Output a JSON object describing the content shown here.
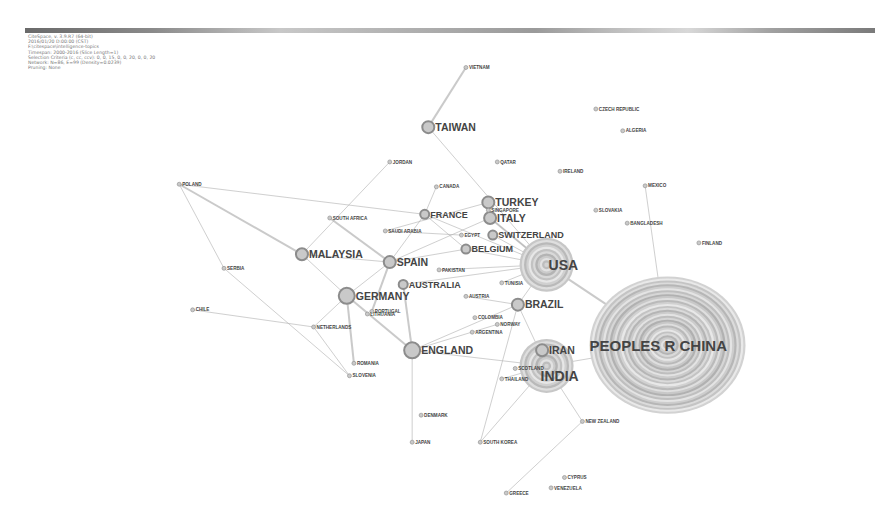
{
  "header": {
    "info_lines": [
      "CiteSpace, v. 3.9.R7 (64-bit)",
      "2016/01/20 D:00:00 (CST)",
      "F:\\citespace\\intelligence-topics",
      "Timespan: 2000-2016 (Slice Length=1)",
      "Selection Criteria (c, cc, ccv): 0, 0, 15, 0, 0, 20, 0, 0, 20",
      "Network: N=86, E=99 (Density=0.0239)",
      "Pruning: None"
    ]
  },
  "colors": {
    "node_ring": "#8c8c8c",
    "node_fill": "#c9c9c9",
    "edge": "#b4b4b4",
    "label": "#444444"
  },
  "network": {
    "nodes": [
      {
        "id": "china",
        "label": "PEOPLES R CHINA",
        "size": 10,
        "x": 0.745,
        "y": 0.665
      },
      {
        "id": "usa",
        "label": "USA",
        "size": 6,
        "x": 0.61,
        "y": 0.51
      },
      {
        "id": "india",
        "label": "INDIA",
        "size": 6,
        "x": 0.61,
        "y": 0.705
      },
      {
        "id": "iran",
        "label": "IRAN",
        "size": 3,
        "x": 0.605,
        "y": 0.675
      },
      {
        "id": "england",
        "label": "ENGLAND",
        "size": 4,
        "x": 0.46,
        "y": 0.675
      },
      {
        "id": "germany",
        "label": "GERMANY",
        "size": 4,
        "x": 0.387,
        "y": 0.57
      },
      {
        "id": "spain",
        "label": "SPAIN",
        "size": 3,
        "x": 0.435,
        "y": 0.505
      },
      {
        "id": "taiwan",
        "label": "TAIWAN",
        "size": 3,
        "x": 0.478,
        "y": 0.245
      },
      {
        "id": "brazil",
        "label": "BRAZIL",
        "size": 3,
        "x": 0.578,
        "y": 0.587
      },
      {
        "id": "italy",
        "label": "ITALY",
        "size": 3,
        "x": 0.547,
        "y": 0.42
      },
      {
        "id": "turkey",
        "label": "TURKEY",
        "size": 3,
        "x": 0.545,
        "y": 0.39
      },
      {
        "id": "malaysia",
        "label": "MALAYSIA",
        "size": 3,
        "x": 0.337,
        "y": 0.49
      },
      {
        "id": "australia",
        "label": "AUSTRALIA",
        "size": 2,
        "x": 0.45,
        "y": 0.548
      },
      {
        "id": "france",
        "label": "FRANCE",
        "size": 2,
        "x": 0.474,
        "y": 0.413
      },
      {
        "id": "belgium",
        "label": "BELGIUM",
        "size": 2,
        "x": 0.52,
        "y": 0.48
      },
      {
        "id": "switzerland",
        "label": "SWITZERLAND",
        "size": 2,
        "x": 0.55,
        "y": 0.453
      },
      {
        "id": "canada",
        "label": "CANADA",
        "size": 1,
        "x": 0.487,
        "y": 0.36
      },
      {
        "id": "japan",
        "label": "JAPAN",
        "size": 1,
        "x": 0.46,
        "y": 0.852
      },
      {
        "id": "south-korea",
        "label": "SOUTH KOREA",
        "size": 1,
        "x": 0.536,
        "y": 0.852
      },
      {
        "id": "greece",
        "label": "GREECE",
        "size": 1,
        "x": 0.565,
        "y": 0.95
      },
      {
        "id": "thailand",
        "label": "THAILAND",
        "size": 1,
        "x": 0.56,
        "y": 0.73
      },
      {
        "id": "portugal",
        "label": "PORTUGAL",
        "size": 1,
        "x": 0.415,
        "y": 0.6
      },
      {
        "id": "pakistan",
        "label": "PAKISTAN",
        "size": 1,
        "x": 0.49,
        "y": 0.52
      },
      {
        "id": "poland",
        "label": "POLAND",
        "size": 1,
        "x": 0.2,
        "y": 0.355
      },
      {
        "id": "serbia",
        "label": "SERBIA",
        "size": 1,
        "x": 0.25,
        "y": 0.517
      },
      {
        "id": "south-africa",
        "label": "SOUTH AFRICA",
        "size": 1,
        "x": 0.368,
        "y": 0.42
      },
      {
        "id": "saudi-arabia",
        "label": "SAUDI ARABIA",
        "size": 1,
        "x": 0.43,
        "y": 0.445
      },
      {
        "id": "egypt",
        "label": "EGYPT",
        "size": 1,
        "x": 0.515,
        "y": 0.453
      },
      {
        "id": "singapore",
        "label": "SINGAPORE",
        "size": 1,
        "x": 0.545,
        "y": 0.405
      },
      {
        "id": "czech",
        "label": "CZECH REPUBLIC",
        "size": 1,
        "x": 0.665,
        "y": 0.21
      },
      {
        "id": "algeria",
        "label": "ALGERIA",
        "size": 1,
        "x": 0.695,
        "y": 0.252
      },
      {
        "id": "mexico",
        "label": "MEXICO",
        "size": 1,
        "x": 0.72,
        "y": 0.358
      },
      {
        "id": "netherlands",
        "label": "NETHERLANDS",
        "size": 1,
        "x": 0.35,
        "y": 0.63
      },
      {
        "id": "chile",
        "label": "CHILE",
        "size": 1,
        "x": 0.215,
        "y": 0.597
      },
      {
        "id": "romania",
        "label": "ROMANIA",
        "size": 1,
        "x": 0.395,
        "y": 0.7
      },
      {
        "id": "slovenia",
        "label": "SLOVENIA",
        "size": 1,
        "x": 0.39,
        "y": 0.724
      },
      {
        "id": "austria",
        "label": "AUSTRIA",
        "size": 1,
        "x": 0.52,
        "y": 0.571
      },
      {
        "id": "norway",
        "label": "NORWAY",
        "size": 1,
        "x": 0.555,
        "y": 0.625
      },
      {
        "id": "argentina",
        "label": "ARGENTINA",
        "size": 1,
        "x": 0.527,
        "y": 0.64
      },
      {
        "id": "tunisia",
        "label": "TUNISIA",
        "size": 1,
        "x": 0.56,
        "y": 0.545
      },
      {
        "id": "scotland",
        "label": "SCOTLAND",
        "size": 1,
        "x": 0.575,
        "y": 0.71
      },
      {
        "id": "new-zealand",
        "label": "NEW ZEALAND",
        "size": 1,
        "x": 0.65,
        "y": 0.812
      },
      {
        "id": "vietnam",
        "label": "VIETNAM",
        "size": 1,
        "x": 0.52,
        "y": 0.13
      },
      {
        "id": "jordan",
        "label": "JORDAN",
        "size": 1,
        "x": 0.435,
        "y": 0.312
      },
      {
        "id": "ireland",
        "label": "IRELAND",
        "size": 1,
        "x": 0.625,
        "y": 0.33
      },
      {
        "id": "slovakia",
        "label": "SLOVAKIA",
        "size": 1,
        "x": 0.665,
        "y": 0.405
      },
      {
        "id": "bangladesh",
        "label": "BANGLADESH",
        "size": 1,
        "x": 0.7,
        "y": 0.43
      },
      {
        "id": "finland",
        "label": "FINLAND",
        "size": 1,
        "x": 0.78,
        "y": 0.468
      },
      {
        "id": "lithuania",
        "label": "LITHUANIA",
        "size": 1,
        "x": 0.41,
        "y": 0.605
      },
      {
        "id": "colombia",
        "label": "COLOMBIA",
        "size": 1,
        "x": 0.53,
        "y": 0.612
      },
      {
        "id": "denmark",
        "label": "DENMARK",
        "size": 1,
        "x": 0.47,
        "y": 0.8
      },
      {
        "id": "cyprus",
        "label": "CYPRUS",
        "size": 1,
        "x": 0.63,
        "y": 0.92
      },
      {
        "id": "venezuela",
        "label": "VENEZUELA",
        "size": 1,
        "x": 0.615,
        "y": 0.94
      },
      {
        "id": "qatar",
        "label": "QATAR",
        "size": 1,
        "x": 0.555,
        "y": 0.312
      }
    ],
    "edges": [
      [
        "usa",
        "china"
      ],
      [
        "india",
        "china"
      ],
      [
        "usa",
        "brazil"
      ],
      [
        "usa",
        "belgium"
      ],
      [
        "usa",
        "italy"
      ],
      [
        "india",
        "iran"
      ],
      [
        "india",
        "thailand"
      ],
      [
        "india",
        "south-korea"
      ],
      [
        "india",
        "new-zealand"
      ],
      [
        "england",
        "japan"
      ],
      [
        "england",
        "germany"
      ],
      [
        "england",
        "brazil"
      ],
      [
        "england",
        "india"
      ],
      [
        "germany",
        "spain"
      ],
      [
        "germany",
        "netherlands"
      ],
      [
        "germany",
        "romania"
      ],
      [
        "germany",
        "malaysia"
      ],
      [
        "spain",
        "france"
      ],
      [
        "spain",
        "belgium"
      ],
      [
        "spain",
        "italy"
      ],
      [
        "spain",
        "south-africa"
      ],
      [
        "france",
        "belgium"
      ],
      [
        "france",
        "poland"
      ],
      [
        "france",
        "canada"
      ],
      [
        "france",
        "usa"
      ],
      [
        "poland",
        "malaysia"
      ],
      [
        "poland",
        "serbia"
      ],
      [
        "serbia",
        "slovenia"
      ],
      [
        "netherlands",
        "chile"
      ],
      [
        "netherlands",
        "slovenia"
      ],
      [
        "taiwan",
        "vietnam"
      ],
      [
        "taiwan",
        "usa"
      ],
      [
        "malaysia",
        "jordan"
      ],
      [
        "malaysia",
        "spain"
      ],
      [
        "australia",
        "usa"
      ],
      [
        "australia",
        "england"
      ],
      [
        "brazil",
        "india"
      ],
      [
        "brazil",
        "south-korea"
      ],
      [
        "greece",
        "new-zealand"
      ],
      [
        "turkey",
        "saudi-arabia"
      ],
      [
        "italy",
        "usa"
      ],
      [
        "switzerland",
        "usa"
      ],
      [
        "egypt",
        "saudi-arabia"
      ],
      [
        "pakistan",
        "usa"
      ],
      [
        "tunisia",
        "usa"
      ],
      [
        "portugal",
        "spain"
      ],
      [
        "austria",
        "brazil"
      ],
      [
        "norway",
        "england"
      ],
      [
        "china",
        "mexico"
      ]
    ]
  }
}
